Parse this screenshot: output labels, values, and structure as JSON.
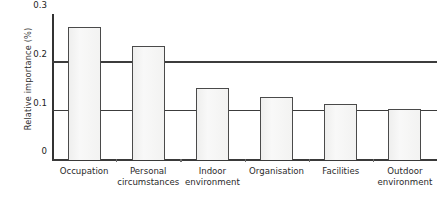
{
  "chart_data": {
    "type": "bar",
    "title": "",
    "xlabel": "",
    "ylabel": "Relative importance (%)",
    "categories": [
      "Occupation",
      "Personal\ncircumstances",
      "Indoor\nenvironment",
      "Organisation",
      "Facilities",
      "Outdoor\nenvironment"
    ],
    "values": [
      0.273,
      0.235,
      0.149,
      0.13,
      0.115,
      0.105
    ],
    "ylim": [
      0,
      0.3
    ],
    "yticks": [
      0,
      0.1,
      0.2,
      0.3
    ],
    "ytick_labels": [
      "0",
      "0.1",
      "0.2",
      "0.3"
    ],
    "gridlines": [
      0.1,
      0.2
    ],
    "grid": true,
    "legend": "none",
    "bar_fill": "#f4f4f3",
    "bar_edge": "#4a4a4a",
    "axis_color": "#333333"
  },
  "axes": {
    "y_title": "Relative importance (%)"
  }
}
